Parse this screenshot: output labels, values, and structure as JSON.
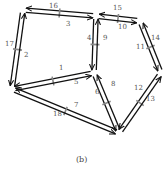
{
  "figure": {
    "caption": "(b)",
    "colors": {
      "edge": "#111111",
      "tick": "#888888",
      "label": "#555555"
    },
    "nodes": [
      {
        "id": "A",
        "x": 23,
        "y": 10
      },
      {
        "id": "B",
        "x": 96,
        "y": 16
      },
      {
        "id": "C",
        "x": 140,
        "y": 21
      },
      {
        "id": "D",
        "x": 12,
        "y": 89
      },
      {
        "id": "E",
        "x": 94,
        "y": 73
      },
      {
        "id": "F",
        "x": 161,
        "y": 73
      },
      {
        "id": "G",
        "x": 119,
        "y": 133
      }
    ],
    "edges": [
      {
        "id": "16",
        "from": "B",
        "to": "A",
        "label": "16"
      },
      {
        "id": "3",
        "from": "A",
        "to": "B",
        "label": "3"
      },
      {
        "id": "15",
        "from": "C",
        "to": "B",
        "label": "15"
      },
      {
        "id": "10",
        "from": "B",
        "to": "C",
        "label": "10"
      },
      {
        "id": "17",
        "from": "A",
        "to": "D",
        "label": "17"
      },
      {
        "id": "2",
        "from": "D",
        "to": "A",
        "label": "2"
      },
      {
        "id": "4",
        "from": "B",
        "to": "E",
        "label": "4"
      },
      {
        "id": "9",
        "from": "E",
        "to": "B",
        "label": "9"
      },
      {
        "id": "14",
        "from": "C",
        "to": "F",
        "label": "14"
      },
      {
        "id": "11",
        "from": "F",
        "to": "C",
        "label": "11"
      },
      {
        "id": "1",
        "from": "E",
        "to": "D",
        "label": "1"
      },
      {
        "id": "5",
        "from": "D",
        "to": "E",
        "label": "5"
      },
      {
        "id": "6",
        "from": "E",
        "to": "G",
        "label": "6"
      },
      {
        "id": "8",
        "from": "G",
        "to": "E",
        "label": "8"
      },
      {
        "id": "12",
        "from": "F",
        "to": "G",
        "label": "12"
      },
      {
        "id": "13",
        "from": "G",
        "to": "F",
        "label": "13"
      },
      {
        "id": "18",
        "from": "G",
        "to": "D",
        "label": "18"
      },
      {
        "id": "7",
        "from": "D",
        "to": "G",
        "label": "7"
      }
    ],
    "labels": [
      {
        "text": "16",
        "x": 49,
        "y": 3
      },
      {
        "text": "3",
        "x": 66,
        "y": 21
      },
      {
        "text": "15",
        "x": 113,
        "y": 5
      },
      {
        "text": "10",
        "x": 118,
        "y": 24
      },
      {
        "text": "17",
        "x": 5,
        "y": 41
      },
      {
        "text": "2",
        "x": 24,
        "y": 52
      },
      {
        "text": "4",
        "x": 87,
        "y": 35
      },
      {
        "text": "9",
        "x": 103,
        "y": 35
      },
      {
        "text": "14",
        "x": 151,
        "y": 35
      },
      {
        "text": "11",
        "x": 136,
        "y": 44
      },
      {
        "text": "1",
        "x": 59,
        "y": 65
      },
      {
        "text": "5",
        "x": 74,
        "y": 79
      },
      {
        "text": "6",
        "x": 95,
        "y": 89
      },
      {
        "text": "8",
        "x": 111,
        "y": 81
      },
      {
        "text": "12",
        "x": 134,
        "y": 85
      },
      {
        "text": "13",
        "x": 146,
        "y": 96
      },
      {
        "text": "7",
        "x": 74,
        "y": 102
      },
      {
        "text": "18",
        "x": 53,
        "y": 111
      }
    ]
  }
}
